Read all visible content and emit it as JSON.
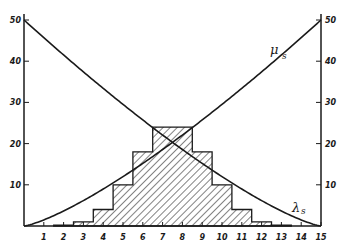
{
  "chart_data": {
    "type": "bar",
    "title": "",
    "xlabel": "",
    "ylabel": "",
    "xlim": [
      0,
      15
    ],
    "ylim": [
      0,
      50
    ],
    "grid": false,
    "x_ticks": [
      "1",
      "2",
      "3",
      "4",
      "5",
      "6",
      "7",
      "8",
      "9",
      "10",
      "11",
      "12",
      "13",
      "14",
      "15"
    ],
    "y_ticks_left": [
      "10",
      "20",
      "30",
      "40",
      "50"
    ],
    "y_ticks_right": [
      "10",
      "20",
      "30",
      "40",
      "50"
    ],
    "histogram": {
      "name": "distribution",
      "hatch": "diagonal",
      "bins": [
        {
          "x": 2,
          "value": 0.2
        },
        {
          "x": 3,
          "value": 1
        },
        {
          "x": 4,
          "value": 4
        },
        {
          "x": 5,
          "value": 10
        },
        {
          "x": 6,
          "value": 18
        },
        {
          "x": 7,
          "value": 24
        },
        {
          "x": 8,
          "value": 24
        },
        {
          "x": 9,
          "value": 18
        },
        {
          "x": 10,
          "value": 10
        },
        {
          "x": 11,
          "value": 4
        },
        {
          "x": 12,
          "value": 1
        },
        {
          "x": 13,
          "value": 0.2
        }
      ]
    },
    "series": [
      {
        "name": "μ_s",
        "label": "μ",
        "subscript": "s",
        "type": "line",
        "x": [
          0,
          1.5,
          3,
          4.5,
          6,
          7.5,
          9,
          10.5,
          12,
          13.5,
          15
        ],
        "values": [
          0,
          2.5,
          5.4,
          8.6,
          12.4,
          20.3,
          23.2,
          28.7,
          35.2,
          42.6,
          50
        ]
      },
      {
        "name": "λ_s",
        "label": "λ",
        "subscript": "s",
        "type": "line",
        "x": [
          0,
          1.5,
          3,
          4.5,
          6,
          7.5,
          9,
          10.5,
          12,
          13.5,
          15
        ],
        "values": [
          50,
          42.6,
          35.2,
          28.7,
          23.2,
          20.3,
          12.4,
          8.6,
          5.4,
          2.5,
          0
        ]
      }
    ],
    "annotations": [
      {
        "text": "μ",
        "sub": "s",
        "near": "upper right of rising curve"
      },
      {
        "text": "λ",
        "sub": "s",
        "near": "lower right of falling curve"
      }
    ]
  }
}
